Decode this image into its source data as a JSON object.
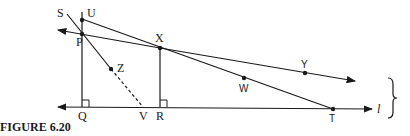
{
  "figure": {
    "caption": "FIGURE 6.20",
    "line_label": "l",
    "points": {
      "S": "S",
      "U": "U",
      "P": "P",
      "X": "X",
      "Y": "Y",
      "Z": "Z",
      "W": "W",
      "Q": "Q",
      "V": "V",
      "R": "R",
      "T": "T"
    },
    "colors": {
      "ink": "#1a1a1a",
      "background": "#ffffff"
    }
  }
}
